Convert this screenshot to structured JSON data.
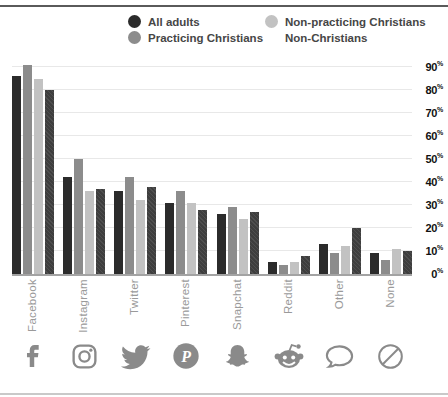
{
  "colors": {
    "all_adults": "#2b2b2b",
    "practicing_christians": "#8c8c8c",
    "non_practicing_christians": "#c2c2c2",
    "non_christians": "#3e3e3e",
    "icon_gray": "#8a8a8a",
    "axis_line": "#a3a3a3",
    "gridline": "#e8e8e8",
    "top_rule": "#5a5a5a",
    "bottom_rule": "#c9c9c9"
  },
  "legend": {
    "items": [
      {
        "label": "All adults",
        "color": "#2b2b2b",
        "pattern": "solid"
      },
      {
        "label": "Non-practicing Christians",
        "color": "#c2c2c2",
        "pattern": "solid"
      },
      {
        "label": "Practicing Christians",
        "color": "#8c8c8c",
        "pattern": "solid"
      },
      {
        "label": "Non-Christians",
        "color": "#3e3e3e",
        "pattern": "hatch"
      }
    ]
  },
  "chart_data": {
    "type": "bar",
    "title": "",
    "xlabel": "",
    "ylabel": "",
    "categories": [
      "Facebook",
      "Instagram",
      "Twitter",
      "Pinterest",
      "Snapchat",
      "Reddit",
      "Other",
      "None"
    ],
    "series": [
      {
        "name": "All adults",
        "color": "#2b2b2b",
        "pattern": "solid",
        "values": [
          86,
          42,
          36,
          31,
          26,
          5,
          13,
          9
        ]
      },
      {
        "name": "Practicing Christians",
        "color": "#8c8c8c",
        "pattern": "solid",
        "values": [
          91,
          50,
          42,
          36,
          29,
          4,
          9,
          6
        ]
      },
      {
        "name": "Non-practicing Christians",
        "color": "#c2c2c2",
        "pattern": "solid",
        "values": [
          85,
          36,
          32,
          31,
          24,
          5,
          12,
          11
        ]
      },
      {
        "name": "Non-Christians",
        "color": "#3e3e3e",
        "pattern": "hatch",
        "values": [
          80,
          37,
          38,
          28,
          27,
          8,
          20,
          10
        ]
      }
    ],
    "y_ticks": [
      0,
      10,
      20,
      30,
      40,
      50,
      60,
      70,
      80,
      90
    ],
    "y_tick_suffix": "%",
    "ylim": [
      0,
      95
    ],
    "grid": true,
    "y_axis_position": "right",
    "legend_position": "top",
    "x_icons": [
      "facebook-icon",
      "instagram-icon",
      "twitter-icon",
      "pinterest-icon",
      "snapchat-icon",
      "reddit-icon",
      "chat-bubble-icon",
      "none-icon"
    ]
  }
}
